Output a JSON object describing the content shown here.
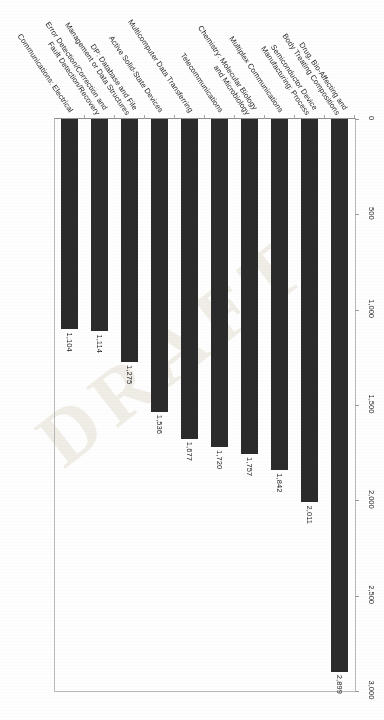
{
  "document": {
    "watermark": "DRAFT",
    "orientation": "rotated-90"
  },
  "chart_data": {
    "type": "bar",
    "orientation": "horizontal",
    "title": "",
    "subtitle": "",
    "xlabel": "",
    "ylabel": "",
    "xlim": [
      0,
      3000
    ],
    "xticks": [
      "0",
      "500",
      "1,000",
      "1,500",
      "2,000",
      "2,500",
      "3,000"
    ],
    "xtick_values": [
      0,
      500,
      1000,
      1500,
      2000,
      2500,
      3000
    ],
    "grid": false,
    "legend": false,
    "bar_color": "#2b2b2b",
    "categories": [
      "Drug, Bio-Affecting and Body Treating Compositions",
      "Semiconductor Device Manufacturing: Process",
      "Multiplex Communications",
      "Chemistry: Molecular Biology and Microbiology",
      "Telecommunications",
      "Multicomputer Data Transferring",
      "Active Solid-State Devices",
      "DP: Database and File Management or Data Structures",
      "Error Detection/Correction and Fault Detection/Recovery",
      "Communications: Electrical"
    ],
    "category_lines": [
      [
        "Drug, Bio-Affecting and",
        "Body Treating Compositions"
      ],
      [
        "Semiconductor Device",
        "Manufacturing: Process"
      ],
      [
        "Multiplex Communications"
      ],
      [
        "Chemistry: Molecular Biology",
        "and Microbiology"
      ],
      [
        "Telecommunications"
      ],
      [
        "Multicomputer Data Transferring"
      ],
      [
        "Active Solid-State Devices"
      ],
      [
        "DP: Database and File",
        "Management or Data Structures"
      ],
      [
        "Error Detection/Correction and",
        "Fault Detection/Recovery"
      ],
      [
        "Communications: Electrical"
      ]
    ],
    "values": [
      2899,
      2011,
      1842,
      1757,
      1720,
      1677,
      1536,
      1275,
      1114,
      1104
    ],
    "value_labels": [
      "2,899",
      "2,011",
      "1,842",
      "1,757",
      "1,720",
      "1,677",
      "1,536",
      "1,275",
      "1,114",
      "1,104"
    ]
  }
}
